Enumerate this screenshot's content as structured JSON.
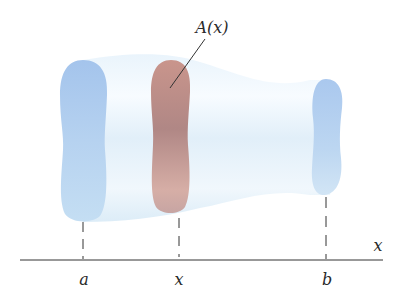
{
  "diagram": {
    "title_label": "A(x)",
    "axis": {
      "label": "x"
    },
    "ticks": [
      {
        "id": "a",
        "label": "a"
      },
      {
        "id": "x",
        "label": "x"
      },
      {
        "id": "b",
        "label": "b"
      }
    ],
    "colors": {
      "solid_body": "#d9ebf7",
      "end_cap": "#a9c8ec",
      "cross_section": "#b98a86",
      "axis_line": "#333333",
      "background": "#ffffff"
    }
  }
}
